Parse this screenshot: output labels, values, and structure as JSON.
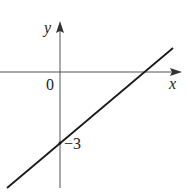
{
  "diagram": {
    "type": "line_graph",
    "axes": {
      "x_label": "x",
      "y_label": "y",
      "origin_label": "0"
    },
    "line": {
      "y_intercept": -3,
      "y_intercept_label": "−3",
      "slope_sign": "positive"
    },
    "colors": {
      "axis": "#555555",
      "line": "#1a1a1a",
      "background": "#ffffff"
    }
  }
}
